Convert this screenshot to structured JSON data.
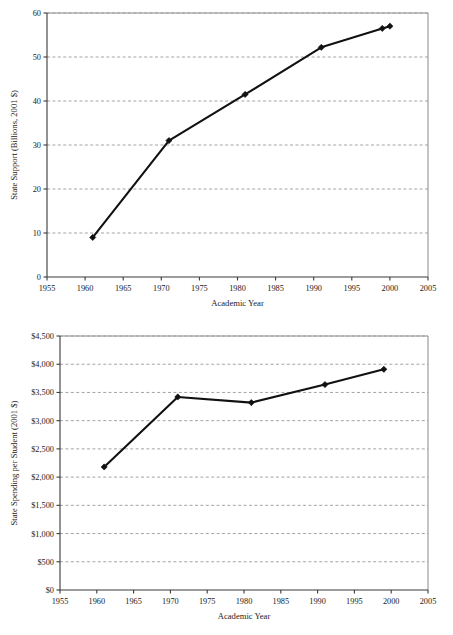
{
  "document": {
    "kind": "two-panel-line-figure",
    "background_color": "#ffffff",
    "ink_color": "#111111",
    "grid_color": "#9a9a9a"
  },
  "chart_data": [
    {
      "id": "state-support-total",
      "type": "line",
      "title": "",
      "xlabel": "Academic Year",
      "ylabel": "State Support (Billions, 2001 $)",
      "xlim": [
        1955,
        2005
      ],
      "ylim": [
        0,
        60
      ],
      "xticks": [
        1955,
        1960,
        1965,
        1970,
        1975,
        1980,
        1985,
        1990,
        1995,
        2000,
        2005
      ],
      "xtick_labels": [
        "1955",
        "1960",
        "1965",
        "1970",
        "1975",
        "1980",
        "1985",
        "1990",
        "1995",
        "2000",
        "2005"
      ],
      "yticks": [
        0,
        10,
        20,
        30,
        40,
        50,
        60
      ],
      "ytick_labels": [
        "0",
        "10",
        "20",
        "30",
        "40",
        "50",
        "60"
      ],
      "grid": "horizontal-dashed",
      "legend": "none",
      "marker": "diamond",
      "x": [
        1961,
        1971,
        1981,
        1991,
        1999,
        2000
      ],
      "values": [
        9.0,
        31.0,
        41.5,
        52.2,
        56.5,
        57.0
      ],
      "point_labels": [
        "1961",
        "1971",
        "1981",
        "1991",
        "1999",
        "2000"
      ]
    },
    {
      "id": "state-spending-per-student",
      "type": "line",
      "title": "",
      "xlabel": "Academic Year",
      "ylabel": "State Spending per Student (2001 $)",
      "xlim": [
        1955,
        2005
      ],
      "ylim": [
        0,
        4500
      ],
      "xticks": [
        1955,
        1960,
        1965,
        1970,
        1975,
        1980,
        1985,
        1990,
        1995,
        2000,
        2005
      ],
      "xtick_labels": [
        "1955",
        "1960",
        "1965",
        "1970",
        "1975",
        "1980",
        "1985",
        "1990",
        "1995",
        "2000",
        "2005"
      ],
      "yticks": [
        0,
        500,
        1000,
        1500,
        2000,
        2500,
        3000,
        3500,
        4000,
        4500
      ],
      "ytick_labels": [
        "$0",
        "$500",
        "$1,000",
        "$1,500",
        "$2,000",
        "$2,500",
        "$3,000",
        "$3,500",
        "$4,000",
        "$4,500"
      ],
      "grid": "horizontal-dashed",
      "legend": "none",
      "marker": "diamond",
      "x": [
        1961,
        1971,
        1981,
        1991,
        1999
      ],
      "values": [
        2180,
        3420,
        3320,
        3640,
        3910
      ],
      "point_labels": [
        "1961",
        "1971",
        "1981",
        "1991",
        "1999"
      ]
    }
  ]
}
